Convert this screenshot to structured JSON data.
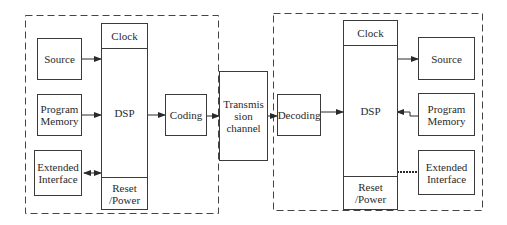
{
  "diagram": {
    "type": "block-diagram",
    "transmitter": {
      "container": "dashed-boundary",
      "dsp": {
        "top": "Clock",
        "center": "DSP",
        "bottom": "Reset\n/Power"
      },
      "source": "Source",
      "program_memory": "Program\nMemory",
      "extended_interface": "Extended\nInterface",
      "coding": "Coding"
    },
    "channel": {
      "label": "Transmis\nsion\nchannel"
    },
    "receiver": {
      "container": "dashed-boundary",
      "decoding": "Decoding",
      "dsp": {
        "top": "Clock",
        "center": "DSP",
        "bottom": "Reset\n/Power"
      },
      "source": "Source",
      "program_memory": "Program\nMemory",
      "extended_interface": "Extended\nInterface"
    },
    "connections": [
      {
        "from": "Source",
        "to": "DSP (transmitter)",
        "arrow": "single"
      },
      {
        "from": "Program Memory",
        "to": "DSP (transmitter)",
        "arrow": "single"
      },
      {
        "from": "Extended Interface",
        "to": "DSP (transmitter)",
        "arrow": "bidirectional"
      },
      {
        "from": "DSP (transmitter)",
        "to": "Coding",
        "arrow": "single"
      },
      {
        "from": "Coding",
        "to": "Transmission channel",
        "arrow": "single"
      },
      {
        "from": "Transmission channel",
        "to": "Decoding",
        "arrow": "single"
      },
      {
        "from": "Decoding",
        "to": "DSP (receiver)",
        "arrow": "single"
      },
      {
        "from": "DSP (receiver)",
        "to": "Source",
        "arrow": "single"
      },
      {
        "from": "Program Memory",
        "to": "DSP (receiver)",
        "arrow": "single"
      },
      {
        "from": "Extended Interface",
        "to": "DSP (receiver)",
        "arrow": "bidirectional"
      }
    ],
    "colors": {
      "line": "#3a3a3a",
      "background": "#ffffff"
    }
  }
}
